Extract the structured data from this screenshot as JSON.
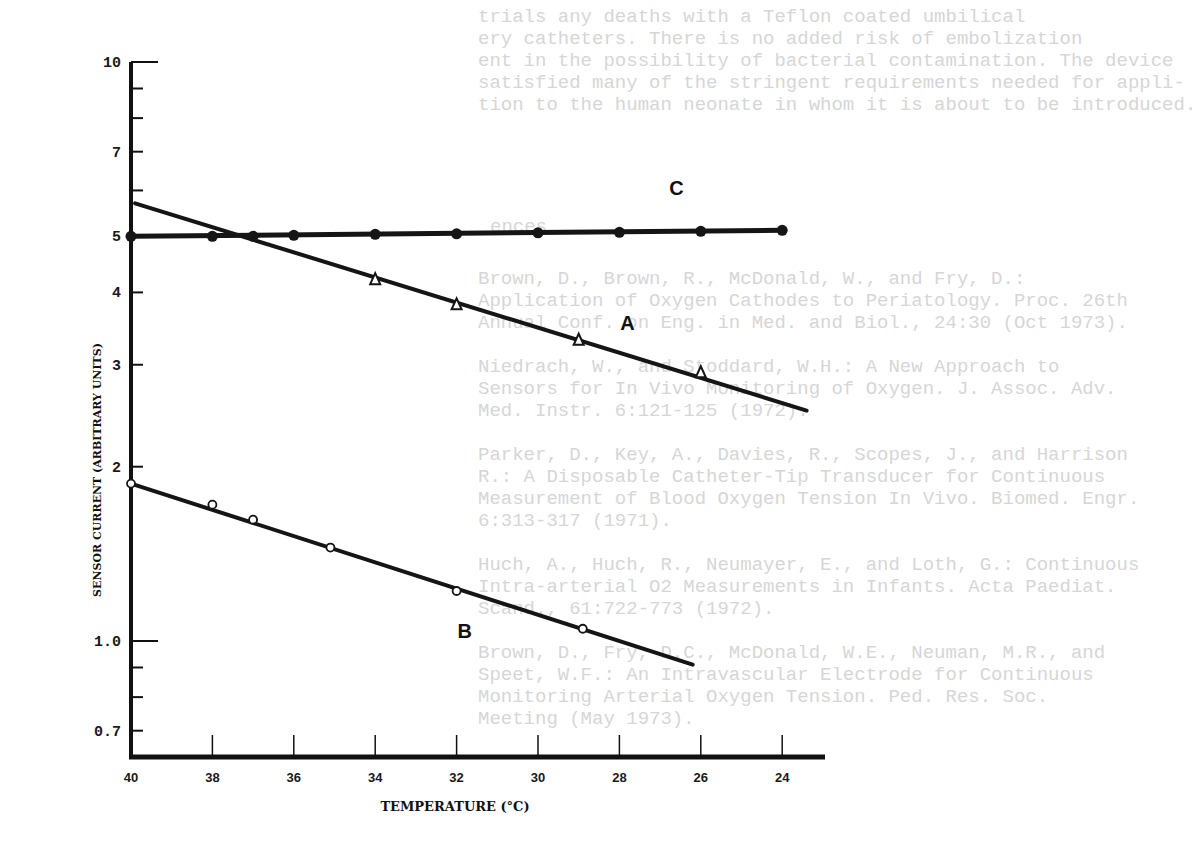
{
  "background_text": {
    "lines": [
      {
        "x": 478,
        "y": 22,
        "text": "trials any deaths with a Teflon coated umbilical"
      },
      {
        "x": 478,
        "y": 44,
        "text": "ery catheters. There is no added risk of embolization"
      },
      {
        "x": 478,
        "y": 66,
        "text": "ent in the possibility of bacterial contamination. The device"
      },
      {
        "x": 478,
        "y": 88,
        "text": "satisfied many of the stringent requirements needed for appli-"
      },
      {
        "x": 478,
        "y": 110,
        "text": "tion to the human neonate in whom it is about to be introduced."
      },
      {
        "x": 820,
        "y": 232,
        "text": "ences"
      },
      {
        "x": 808,
        "y": 284,
        "text": "Brown, D., Brown, R., McDonald, W., and Fry, D.:"
      },
      {
        "x": 808,
        "y": 306,
        "text": "Application of Oxygen Cathodes to Periatology. Proc. 26th"
      },
      {
        "x": 808,
        "y": 328,
        "text": "Annual Conf. on Eng. in Med. and Biol., 24:30 (Oct 1973)."
      },
      {
        "x": 808,
        "y": 372,
        "text": "Niedrach, W., and Stoddard, W.H.: A New Approach to"
      },
      {
        "x": 808,
        "y": 394,
        "text": "Sensors for In Vivo Monitoring of Oxygen. J. Assoc. Adv."
      },
      {
        "x": 808,
        "y": 416,
        "text": "Med. Instr. 6:121-125 (1972)."
      },
      {
        "x": 808,
        "y": 460,
        "text": "Parker, D., Key, A., Davies, R., Scopes, J., and Harrison"
      },
      {
        "x": 808,
        "y": 482,
        "text": "R.: A Disposable Catheter-Tip Transducer for Continuous"
      },
      {
        "x": 808,
        "y": 504,
        "text": "Measurement of Blood Oxygen Tension In Vivo. Biomed. Engr."
      },
      {
        "x": 808,
        "y": 526,
        "text": "6:313-317 (1971)."
      },
      {
        "x": 808,
        "y": 570,
        "text": "Huch, A., Huch, R., Neumayer, E., and Loth, G.: Continuous"
      },
      {
        "x": 808,
        "y": 592,
        "text": "Intra-arterial O2 Measurements in Infants. Acta Paediat."
      },
      {
        "x": 808,
        "y": 614,
        "text": "Scand., 61:722-773 (1972)."
      },
      {
        "x": 808,
        "y": 658,
        "text": "Brown, D., Fry, D.C., McDonald, W.E., Neuman, M.R., and"
      },
      {
        "x": 808,
        "y": 680,
        "text": "Speet, W.F.: An Intravascular Electrode for Continuous"
      },
      {
        "x": 808,
        "y": 702,
        "text": "Monitoring Arterial Oxygen Tension. Ped. Res. Soc."
      },
      {
        "x": 808,
        "y": 724,
        "text": "Meeting (May 1973)."
      }
    ]
  },
  "chart_data": {
    "type": "line",
    "title": "",
    "xlabel": "TEMPERATURE (°C)",
    "ylabel": "SENSOR CURRENT (ARBITRARY UNITS)",
    "x_reversed": true,
    "xlim": [
      40,
      23
    ],
    "y_scale": "log",
    "ylim": [
      0.62,
      10
    ],
    "grid": false,
    "legend": "inline labels A, B, C next to each line",
    "x_ticks": [
      "40",
      "38",
      "36",
      "34",
      "32",
      "30",
      "28",
      "26",
      "24"
    ],
    "y_ticks": [
      {
        "value": 10,
        "label": "10"
      },
      {
        "value": 9,
        "label": ""
      },
      {
        "value": 8,
        "label": ""
      },
      {
        "value": 7,
        "label": "7"
      },
      {
        "value": 6,
        "label": ""
      },
      {
        "value": 5,
        "label": "5"
      },
      {
        "value": 4,
        "label": "4"
      },
      {
        "value": 3,
        "label": "3"
      },
      {
        "value": 2,
        "label": "2"
      },
      {
        "value": 1.0,
        "label": "1.0"
      },
      {
        "value": 0.9,
        "label": ""
      },
      {
        "value": 0.8,
        "label": ""
      },
      {
        "value": 0.7,
        "label": "0.7"
      }
    ],
    "series": [
      {
        "name": "C",
        "marker": "filled-circle",
        "x": [
          40,
          38,
          37,
          36,
          34,
          32,
          30,
          28,
          26,
          24
        ],
        "y": [
          5.0,
          5.0,
          5.0,
          5.02,
          5.04,
          5.05,
          5.07,
          5.08,
          5.1,
          5.12
        ],
        "line_x": [
          40,
          24
        ],
        "line_y": [
          5.0,
          5.12
        ]
      },
      {
        "name": "A",
        "marker": "open-triangle",
        "x": [
          34,
          32,
          29,
          26
        ],
        "y": [
          4.2,
          3.8,
          3.3,
          2.9
        ],
        "line_x": [
          39.9,
          23.4
        ],
        "line_y": [
          5.7,
          2.5
        ]
      },
      {
        "name": "B",
        "marker": "open-circle",
        "x": [
          40,
          38,
          37,
          35.1,
          32,
          28.9
        ],
        "y": [
          1.87,
          1.72,
          1.62,
          1.45,
          1.22,
          1.05
        ],
        "line_x": [
          40,
          26.2
        ],
        "line_y": [
          1.87,
          0.91
        ]
      }
    ],
    "annotations": [
      {
        "text": "C",
        "x": 26.6,
        "y": 5.9
      },
      {
        "text": "A",
        "x": 27.8,
        "y": 3.45
      },
      {
        "text": "B",
        "x": 31.8,
        "y": 1.01
      }
    ]
  }
}
